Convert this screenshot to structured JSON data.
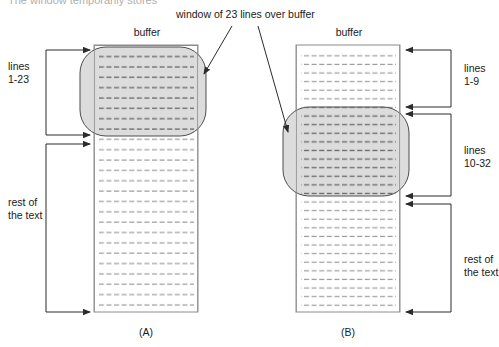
{
  "figure": {
    "caption_top_partial": "The window temporarily stores",
    "title_annotation": "window of 23 lines over buffer",
    "panels": [
      {
        "id": "A",
        "label": "(A)",
        "buffer_label": "buffer",
        "brackets": [
          {
            "name": "lines-1-23",
            "text_line1": "lines",
            "text_line2": "1-23"
          },
          {
            "name": "rest-of-text",
            "text_line1": "rest of",
            "text_line2": "the text"
          }
        ]
      },
      {
        "id": "B",
        "label": "(B)",
        "buffer_label": "buffer",
        "brackets": [
          {
            "name": "lines-1-9",
            "text_line1": "lines",
            "text_line2": "1-9"
          },
          {
            "name": "lines-10-32",
            "text_line1": "lines",
            "text_line2": "10-32"
          },
          {
            "name": "rest-of-text",
            "text_line1": "rest of",
            "text_line2": "the text"
          }
        ]
      }
    ],
    "colors": {
      "window_fill": "#d9d9d9",
      "window_stroke": "#4d4d4d",
      "buffer_stroke": "#8c8c8c",
      "text_line": "#9a9a9a",
      "text_line_dark": "#6e6e6e",
      "arrow": "#2b2b2b",
      "background": "#ffffff"
    }
  }
}
